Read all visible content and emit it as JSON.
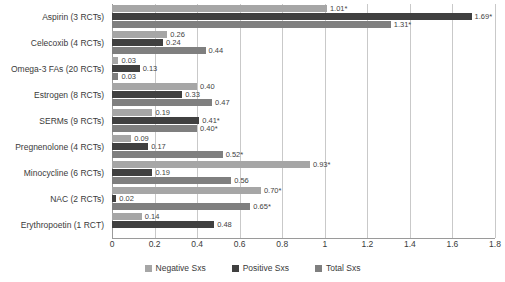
{
  "chart_data": {
    "type": "bar",
    "orientation": "horizontal",
    "title": "",
    "xlabel": "",
    "ylabel": "",
    "xlim": [
      0,
      1.8
    ],
    "xticks": [
      "0",
      "0.2",
      "0.4",
      "0.6",
      "0.8",
      "1",
      "1.2",
      "1.4",
      "1.6",
      "1.8"
    ],
    "xtick_values": [
      0,
      0.2,
      0.4,
      0.6,
      0.8,
      1,
      1.2,
      1.4,
      1.6,
      1.8
    ],
    "grid": true,
    "legend_position": "bottom",
    "categories": [
      "Aspirin (3 RCTs)",
      "Celecoxib (4 RCTs)",
      "Omega-3 FAs (20 RCTs)",
      "Estrogen (8 RCTs)",
      "SERMs (9 RCTs)",
      "Pregnenolone (4 RCTs)",
      "Minocycline (6 RCTs)",
      "NAC (2 RCTs)",
      "Erythropoetin (1 RCT)"
    ],
    "series": [
      {
        "name": "Negative Sxs",
        "color": "#a6a6a6",
        "values": [
          1.01,
          0.26,
          0.03,
          0.4,
          0.19,
          0.09,
          0.93,
          0.7,
          0.14
        ],
        "labels": [
          "1.01*",
          "0.26",
          "0.03",
          "0.40",
          "0.19",
          "0.09",
          "0.93*",
          "0.70*",
          "0.14"
        ]
      },
      {
        "name": "Positive Sxs",
        "color": "#404040",
        "values": [
          1.69,
          0.24,
          0.13,
          0.33,
          0.41,
          0.17,
          0.19,
          0.02,
          0.48
        ],
        "labels": [
          "1.69*",
          "0.24",
          "0.13",
          "0.33",
          "0.41*",
          "0.17",
          "0.19",
          "0.02",
          "0.48"
        ]
      },
      {
        "name": "Total Sxs",
        "color": "#7f7f7f",
        "values": [
          1.31,
          0.44,
          0.03,
          0.47,
          0.4,
          0.52,
          0.56,
          0.65,
          null
        ],
        "labels": [
          "1.31*",
          "0.44",
          "0.03",
          "0.47",
          "0.40*",
          "0.52*",
          "0.56",
          "0.65*",
          ""
        ]
      }
    ]
  },
  "legend": {
    "items": [
      {
        "label": "Negative Sxs",
        "key": "neg"
      },
      {
        "label": "Positive Sxs",
        "key": "pos"
      },
      {
        "label": "Total Sxs",
        "key": "tot"
      }
    ]
  }
}
